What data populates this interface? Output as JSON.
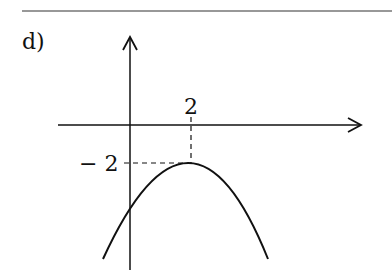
{
  "problem": {
    "part_label": "d)"
  },
  "graph": {
    "x_tick_label": "2",
    "y_tick_label": "− 2",
    "vertex": {
      "x": 2,
      "y": -2
    },
    "curve": "downward-opening parabola",
    "colors": {
      "ink": "#111111",
      "background": "#ffffff"
    }
  }
}
